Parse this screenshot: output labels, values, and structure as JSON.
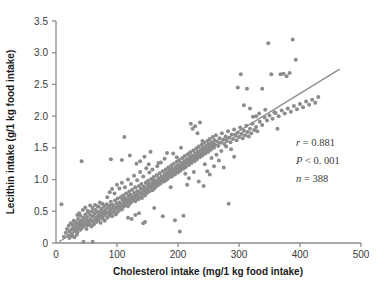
{
  "chart_data": {
    "type": "scatter",
    "title": "",
    "xlabel": "Cholesterol intake (mg/1 kg food intake)",
    "ylabel": "Lecithin intake (g/1 kg food intake)",
    "xlim": [
      0,
      500
    ],
    "ylim": [
      0,
      3.5
    ],
    "xticks": [
      0,
      100,
      200,
      300,
      400,
      500
    ],
    "yticks": [
      0,
      0.5,
      1.0,
      1.5,
      2.0,
      2.5,
      3.0,
      3.5
    ],
    "xtick_labels": [
      "0",
      "100",
      "200",
      "300",
      "400",
      "500"
    ],
    "ytick_labels": [
      "0",
      "0.5",
      "1.0",
      "1.5",
      "2.0",
      "2.5",
      "3.0",
      "3.5"
    ],
    "grid": false,
    "legend": false,
    "marker_color": "#8c8c8c",
    "marker_size": 4,
    "line_color": "#8c8c8c",
    "axis_color": "#8c8c8c",
    "annotations": [
      {
        "name": "correlation",
        "text": "r = 0.881",
        "italic_prefix": "r"
      },
      {
        "name": "p-value",
        "text": "P < 0. 001",
        "italic_prefix": "P"
      },
      {
        "name": "sample-size",
        "text": "n = 388",
        "italic_prefix": "n"
      }
    ],
    "statistics": {
      "r": 0.881,
      "p": "< 0. 001",
      "n": 388
    },
    "fit_line": {
      "type": "linear",
      "x_start": 5,
      "y_start": 0.02,
      "x_end": 465,
      "y_end": 2.74,
      "slope": 0.005913,
      "intercept": -0.0096
    },
    "points": [
      [
        9,
        0.61
      ],
      [
        13,
        0.1
      ],
      [
        16,
        0.16
      ],
      [
        18,
        0.22
      ],
      [
        20,
        0.12
      ],
      [
        21,
        0.27
      ],
      [
        22,
        0.18
      ],
      [
        24,
        0.31
      ],
      [
        25,
        0.21
      ],
      [
        26,
        0.14
      ],
      [
        27,
        0.29
      ],
      [
        28,
        0.24
      ],
      [
        29,
        0.35
      ],
      [
        30,
        0.19
      ],
      [
        31,
        0.26
      ],
      [
        32,
        0.33
      ],
      [
        33,
        0.22
      ],
      [
        34,
        0.3
      ],
      [
        35,
        0.17
      ],
      [
        36,
        0.38
      ],
      [
        37,
        0.25
      ],
      [
        38,
        0.32
      ],
      [
        39,
        0.28
      ],
      [
        40,
        0.21
      ],
      [
        40,
        0.43
      ],
      [
        41,
        0.36
      ],
      [
        42,
        1.29
      ],
      [
        42,
        0.29
      ],
      [
        43,
        0.24
      ],
      [
        44,
        0.34
      ],
      [
        45,
        0.4
      ],
      [
        45,
        0.02
      ],
      [
        46,
        0.27
      ],
      [
        47,
        0.31
      ],
      [
        48,
        0.45
      ],
      [
        49,
        0.37
      ],
      [
        50,
        0.22
      ],
      [
        50,
        0.33
      ],
      [
        51,
        0.41
      ],
      [
        52,
        0.28
      ],
      [
        53,
        0.48
      ],
      [
        54,
        0.35
      ],
      [
        55,
        0.3
      ],
      [
        56,
        0.44
      ],
      [
        57,
        0.38
      ],
      [
        58,
        0.26
      ],
      [
        59,
        0.5
      ],
      [
        60,
        0.34
      ],
      [
        60,
        0.02
      ],
      [
        61,
        0.42
      ],
      [
        62,
        0.29
      ],
      [
        63,
        0.46
      ],
      [
        64,
        0.37
      ],
      [
        65,
        0.52
      ],
      [
        66,
        0.33
      ],
      [
        67,
        0.41
      ],
      [
        68,
        0.48
      ],
      [
        69,
        0.36
      ],
      [
        70,
        0.44
      ],
      [
        70,
        0.57
      ],
      [
        71,
        0.39
      ],
      [
        72,
        0.5
      ],
      [
        73,
        0.32
      ],
      [
        74,
        0.46
      ],
      [
        75,
        0.54
      ],
      [
        76,
        0.42
      ],
      [
        77,
        0.38
      ],
      [
        78,
        0.49
      ],
      [
        79,
        0.58
      ],
      [
        80,
        0.44
      ],
      [
        80,
        0.35
      ],
      [
        81,
        0.52
      ],
      [
        82,
        0.47
      ],
      [
        83,
        0.61
      ],
      [
        84,
        0.4
      ],
      [
        85,
        0.55
      ],
      [
        86,
        0.48
      ],
      [
        87,
        0.43
      ],
      [
        88,
        0.59
      ],
      [
        89,
        0.51
      ],
      [
        90,
        0.46
      ],
      [
        90,
        0.65
      ],
      [
        91,
        0.54
      ],
      [
        92,
        0.42
      ],
      [
        93,
        0.6
      ],
      [
        94,
        0.49
      ],
      [
        95,
        0.57
      ],
      [
        96,
        0.52
      ],
      [
        97,
        0.67
      ],
      [
        98,
        0.45
      ],
      [
        99,
        0.62
      ],
      [
        100,
        0.55
      ],
      [
        100,
        0.48
      ],
      [
        101,
        0.7
      ],
      [
        102,
        0.58
      ],
      [
        103,
        0.51
      ],
      [
        104,
        0.64
      ],
      [
        105,
        0.56
      ],
      [
        106,
        0.72
      ],
      [
        107,
        0.6
      ],
      [
        108,
        0.53
      ],
      [
        109,
        0.68
      ],
      [
        110,
        0.62
      ],
      [
        110,
        0.75
      ],
      [
        111,
        0.57
      ],
      [
        112,
        0.66
      ],
      [
        113,
        0.71
      ],
      [
        114,
        0.6
      ],
      [
        115,
        0.78
      ],
      [
        116,
        0.64
      ],
      [
        117,
        0.69
      ],
      [
        118,
        0.58
      ],
      [
        119,
        0.74
      ],
      [
        120,
        0.67
      ],
      [
        120,
        0.81
      ],
      [
        121,
        0.62
      ],
      [
        122,
        0.76
      ],
      [
        123,
        0.7
      ],
      [
        124,
        0.65
      ],
      [
        125,
        0.84
      ],
      [
        126,
        0.72
      ],
      [
        127,
        0.68
      ],
      [
        128,
        0.79
      ],
      [
        129,
        0.74
      ],
      [
        130,
        0.66
      ],
      [
        130,
        0.88
      ],
      [
        131,
        0.77
      ],
      [
        132,
        0.71
      ],
      [
        133,
        0.82
      ],
      [
        134,
        0.75
      ],
      [
        135,
        0.69
      ],
      [
        136,
        0.9
      ],
      [
        137,
        0.8
      ],
      [
        138,
        0.73
      ],
      [
        139,
        0.86
      ],
      [
        140,
        0.78
      ],
      [
        140,
        0.93
      ],
      [
        141,
        0.71
      ],
      [
        142,
        0.84
      ],
      [
        143,
        0.77
      ],
      [
        144,
        0.89
      ],
      [
        145,
        0.82
      ],
      [
        146,
        0.75
      ],
      [
        147,
        0.95
      ],
      [
        148,
        0.86
      ],
      [
        149,
        0.79
      ],
      [
        150,
        0.92
      ],
      [
        150,
        0.84
      ],
      [
        151,
        0.98
      ],
      [
        152,
        0.88
      ],
      [
        153,
        0.81
      ],
      [
        154,
        0.94
      ],
      [
        155,
        0.87
      ],
      [
        156,
        1.01
      ],
      [
        157,
        0.9
      ],
      [
        158,
        0.83
      ],
      [
        159,
        0.97
      ],
      [
        160,
        0.92
      ],
      [
        160,
        1.04
      ],
      [
        161,
        0.86
      ],
      [
        162,
        0.99
      ],
      [
        163,
        0.94
      ],
      [
        164,
        0.89
      ],
      [
        165,
        1.07
      ],
      [
        166,
        0.96
      ],
      [
        167,
        0.91
      ],
      [
        168,
        1.02
      ],
      [
        169,
        0.97
      ],
      [
        170,
        0.93
      ],
      [
        170,
        1.1
      ],
      [
        171,
        1.0
      ],
      [
        172,
        0.95
      ],
      [
        173,
        1.05
      ],
      [
        174,
        0.99
      ],
      [
        175,
        1.13
      ],
      [
        176,
        1.02
      ],
      [
        177,
        0.97
      ],
      [
        178,
        1.08
      ],
      [
        179,
        1.03
      ],
      [
        180,
        1.16
      ],
      [
        180,
        0.99
      ],
      [
        181,
        1.06
      ],
      [
        182,
        1.11
      ],
      [
        183,
        1.01
      ],
      [
        184,
        1.19
      ],
      [
        185,
        1.09
      ],
      [
        186,
        1.04
      ],
      [
        187,
        1.14
      ],
      [
        188,
        1.07
      ],
      [
        189,
        1.22
      ],
      [
        190,
        1.12
      ],
      [
        190,
        1.05
      ],
      [
        191,
        1.17
      ],
      [
        192,
        1.1
      ],
      [
        193,
        1.25
      ],
      [
        194,
        1.15
      ],
      [
        195,
        1.08
      ],
      [
        196,
        1.2
      ],
      [
        197,
        1.13
      ],
      [
        198,
        1.28
      ],
      [
        199,
        1.18
      ],
      [
        200,
        1.11
      ],
      [
        200,
        1.23
      ],
      [
        201,
        1.16
      ],
      [
        202,
        1.31
      ],
      [
        203,
        1.21
      ],
      [
        204,
        1.14
      ],
      [
        205,
        1.26
      ],
      [
        206,
        1.19
      ],
      [
        207,
        1.34
      ],
      [
        208,
        1.24
      ],
      [
        209,
        1.17
      ],
      [
        210,
        1.29
      ],
      [
        210,
        1.22
      ],
      [
        211,
        1.37
      ],
      [
        212,
        1.27
      ],
      [
        213,
        1.2
      ],
      [
        214,
        1.32
      ],
      [
        215,
        1.25
      ],
      [
        216,
        1.4
      ],
      [
        217,
        1.3
      ],
      [
        218,
        1.23
      ],
      [
        219,
        1.35
      ],
      [
        220,
        1.28
      ],
      [
        220,
        1.43
      ],
      [
        221,
        1.33
      ],
      [
        222,
        1.26
      ],
      [
        223,
        1.38
      ],
      [
        224,
        1.31
      ],
      [
        225,
        1.46
      ],
      [
        226,
        1.36
      ],
      [
        227,
        1.29
      ],
      [
        228,
        1.41
      ],
      [
        229,
        1.34
      ],
      [
        230,
        1.49
      ],
      [
        230,
        1.39
      ],
      [
        231,
        1.32
      ],
      [
        232,
        1.44
      ],
      [
        233,
        1.37
      ],
      [
        234,
        1.52
      ],
      [
        235,
        1.42
      ],
      [
        236,
        1.35
      ],
      [
        237,
        1.47
      ],
      [
        238,
        1.4
      ],
      [
        239,
        1.55
      ],
      [
        240,
        1.45
      ],
      [
        240,
        1.38
      ],
      [
        241,
        1.5
      ],
      [
        242,
        1.43
      ],
      [
        243,
        1.58
      ],
      [
        244,
        1.48
      ],
      [
        245,
        1.41
      ],
      [
        246,
        1.53
      ],
      [
        247,
        1.46
      ],
      [
        248,
        1.61
      ],
      [
        249,
        1.51
      ],
      [
        250,
        1.44
      ],
      [
        250,
        1.56
      ],
      [
        251,
        1.49
      ],
      [
        252,
        1.64
      ],
      [
        253,
        1.54
      ],
      [
        254,
        1.47
      ],
      [
        255,
        1.59
      ],
      [
        256,
        1.52
      ],
      [
        257,
        1.67
      ],
      [
        258,
        1.57
      ],
      [
        259,
        1.5
      ],
      [
        260,
        1.62
      ],
      [
        260,
        1.55
      ],
      [
        262,
        1.7
      ],
      [
        264,
        1.6
      ],
      [
        266,
        1.53
      ],
      [
        268,
        1.65
      ],
      [
        270,
        1.58
      ],
      [
        272,
        1.73
      ],
      [
        274,
        1.63
      ],
      [
        276,
        1.56
      ],
      [
        278,
        1.68
      ],
      [
        280,
        1.61
      ],
      [
        282,
        1.76
      ],
      [
        284,
        1.66
      ],
      [
        286,
        1.59
      ],
      [
        288,
        1.71
      ],
      [
        290,
        1.64
      ],
      [
        292,
        1.79
      ],
      [
        294,
        1.69
      ],
      [
        296,
        1.62
      ],
      [
        298,
        1.74
      ],
      [
        300,
        1.67
      ],
      [
        302,
        1.82
      ],
      [
        304,
        1.72
      ],
      [
        306,
        1.65
      ],
      [
        308,
        1.77
      ],
      [
        310,
        1.7
      ],
      [
        312,
        1.85
      ],
      [
        314,
        1.75
      ],
      [
        316,
        1.68
      ],
      [
        318,
        1.8
      ],
      [
        320,
        1.73
      ],
      [
        322,
        1.88
      ],
      [
        325,
        1.78
      ],
      [
        328,
        1.83
      ],
      [
        330,
        1.76
      ],
      [
        334,
        1.91
      ],
      [
        338,
        1.86
      ],
      [
        342,
        1.98
      ],
      [
        346,
        1.93
      ],
      [
        350,
        2.01
      ],
      [
        355,
        1.96
      ],
      [
        360,
        2.05
      ],
      [
        365,
        2.0
      ],
      [
        370,
        2.09
      ],
      [
        375,
        2.04
      ],
      [
        380,
        2.12
      ],
      [
        385,
        2.07
      ],
      [
        390,
        2.16
      ],
      [
        395,
        2.11
      ],
      [
        400,
        2.19
      ],
      [
        405,
        2.14
      ],
      [
        410,
        2.23
      ],
      [
        415,
        2.18
      ],
      [
        420,
        2.26
      ],
      [
        425,
        2.21
      ],
      [
        430,
        2.3
      ],
      [
        90,
        1.32
      ],
      [
        108,
        1.31
      ],
      [
        112,
        1.67
      ],
      [
        121,
        1.38
      ],
      [
        132,
        1.25
      ],
      [
        138,
        1.29
      ],
      [
        143,
        0.31
      ],
      [
        146,
        0.33
      ],
      [
        155,
        1.44
      ],
      [
        161,
        0.55
      ],
      [
        168,
        1.26
      ],
      [
        175,
        0.42
      ],
      [
        182,
        1.42
      ],
      [
        188,
        0.88
      ],
      [
        195,
        0.36
      ],
      [
        203,
        0.18
      ],
      [
        209,
        0.43
      ],
      [
        215,
        0.92
      ],
      [
        221,
        1.88
      ],
      [
        224,
        1.8
      ],
      [
        228,
        1.84
      ],
      [
        232,
        1.73
      ],
      [
        236,
        1.9
      ],
      [
        240,
        1.61
      ],
      [
        244,
        1.24
      ],
      [
        248,
        1.13
      ],
      [
        252,
        1.08
      ],
      [
        255,
        1.34
      ],
      [
        259,
        1.21
      ],
      [
        263,
        1.39
      ],
      [
        267,
        1.3
      ],
      [
        271,
        1.45
      ],
      [
        275,
        1.19
      ],
      [
        279,
        1.52
      ],
      [
        283,
        0.62
      ],
      [
        287,
        1.48
      ],
      [
        292,
        1.36
      ],
      [
        298,
        2.45
      ],
      [
        303,
        2.66
      ],
      [
        308,
        2.17
      ],
      [
        313,
        2.43
      ],
      [
        318,
        2.12
      ],
      [
        323,
        1.99
      ],
      [
        328,
        2.0
      ],
      [
        333,
        2.04
      ],
      [
        338,
        2.43
      ],
      [
        343,
        2.1
      ],
      [
        348,
        3.15
      ],
      [
        353,
        2.66
      ],
      [
        358,
        2.06
      ],
      [
        363,
        1.8
      ],
      [
        368,
        2.66
      ],
      [
        373,
        2.67
      ],
      [
        378,
        2.63
      ],
      [
        383,
        2.68
      ],
      [
        388,
        3.21
      ],
      [
        393,
        2.89
      ],
      [
        145,
        1.36
      ],
      [
        152,
        1.24
      ],
      [
        158,
        1.16
      ],
      [
        166,
        1.21
      ],
      [
        172,
        1.27
      ],
      [
        178,
        1.33
      ],
      [
        185,
        1.18
      ],
      [
        192,
        1.41
      ],
      [
        198,
        1.35
      ],
      [
        205,
        1.5
      ],
      [
        212,
        1.09
      ],
      [
        218,
        1.02
      ],
      [
        226,
        1.12
      ],
      [
        234,
        0.97
      ],
      [
        242,
        0.9
      ],
      [
        84,
        0.72
      ],
      [
        88,
        0.8
      ],
      [
        92,
        0.85
      ],
      [
        96,
        0.78
      ],
      [
        100,
        0.92
      ],
      [
        104,
        0.86
      ],
      [
        108,
        0.95
      ],
      [
        113,
        0.88
      ],
      [
        118,
        1.0
      ],
      [
        123,
        0.93
      ],
      [
        128,
        1.06
      ],
      [
        133,
        0.99
      ],
      [
        138,
        1.12
      ],
      [
        143,
        1.05
      ],
      [
        148,
        1.18
      ],
      [
        153,
        1.11
      ],
      [
        60,
        0.55
      ],
      [
        64,
        0.6
      ],
      [
        68,
        0.58
      ],
      [
        72,
        0.64
      ],
      [
        76,
        0.62
      ],
      [
        35,
        0.44
      ],
      [
        38,
        0.47
      ],
      [
        44,
        0.52
      ],
      [
        48,
        0.56
      ],
      [
        52,
        0.51
      ],
      [
        56,
        0.59
      ],
      [
        22,
        0.08
      ],
      [
        26,
        0.11
      ],
      [
        30,
        0.09
      ],
      [
        34,
        0.13
      ],
      [
        118,
        0.4
      ],
      [
        124,
        0.38
      ],
      [
        130,
        0.44
      ],
      [
        136,
        0.47
      ]
    ]
  },
  "annotations_block": {
    "r_value": "r = 0.881",
    "p_value": "P < 0. 001",
    "n_value": "n = 388"
  }
}
